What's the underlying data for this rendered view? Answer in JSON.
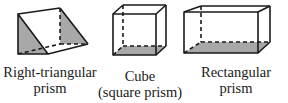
{
  "figure": {
    "shapes": [
      {
        "id": "right-triangular-prism",
        "label_lines": [
          "Right-triangular",
          "prism"
        ]
      },
      {
        "id": "cube",
        "label_lines": [
          "Cube",
          "(square prism)"
        ]
      },
      {
        "id": "rectangular-prism",
        "label_lines": [
          "Rectangular",
          "prism"
        ]
      }
    ],
    "colors": {
      "edge": "#1a1a1a",
      "shade": "#a8a8a8",
      "background": "#ffffff"
    }
  }
}
